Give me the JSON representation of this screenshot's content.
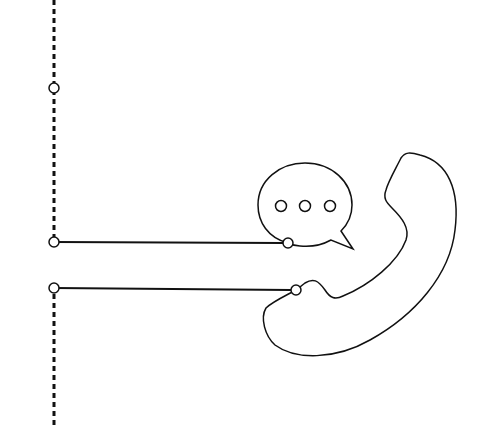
{
  "diagram": {
    "colors": {
      "background": "#ffffff",
      "stroke": "#111111",
      "node_fill": "#ffffff"
    },
    "timeline": {
      "x": 54,
      "segments": [
        [
          0,
          240
        ],
        [
          288,
          427
        ]
      ],
      "nodes": [
        {
          "id": "top-node",
          "cx": 54,
          "cy": 88
        },
        {
          "id": "chat-node",
          "cx": 54,
          "cy": 242
        },
        {
          "id": "phone-node",
          "cx": 54,
          "cy": 288
        }
      ]
    },
    "connectors": [
      {
        "id": "chat-connector",
        "from": [
          54,
          242
        ],
        "to": [
          288,
          243
        ]
      },
      {
        "id": "phone-connector",
        "from": [
          54,
          288
        ],
        "to": [
          296,
          290
        ]
      }
    ],
    "speech_bubble": {
      "icon": "chat-bubble-icon",
      "dots": 3,
      "anchor": [
        288,
        243
      ]
    },
    "phone": {
      "icon": "phone-handset-icon",
      "anchor": [
        296,
        290
      ]
    }
  }
}
